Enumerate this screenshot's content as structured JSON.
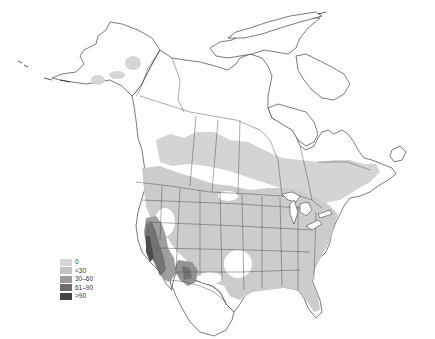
{
  "map": {
    "region": "North America",
    "colors": {
      "land": "#ffffff",
      "outline": "#222222",
      "cat_0": "#d4d4d4",
      "cat_lt30": "#c6c6c6",
      "cat_30_60": "#9a9a9a",
      "cat_61_90": "#6e6e6e",
      "cat_gt90": "#444444"
    }
  },
  "legend": {
    "items": [
      {
        "label": "0",
        "color": "#d6d6d6"
      },
      {
        "label": "<30",
        "color": "#c4c4c4"
      },
      {
        "label": "30–60",
        "color": "#9a9a9a"
      },
      {
        "label": "61–90",
        "color": "#6c6c6c"
      },
      {
        "label": ">90",
        "color": "#444444"
      }
    ]
  }
}
